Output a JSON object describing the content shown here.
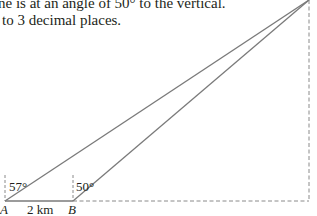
{
  "problem_text": {
    "line1": "ne is at an angle of 50° to the vertical.",
    "line2": "to 3 decimal places."
  },
  "diagram": {
    "points": {
      "A": {
        "label": "A",
        "x": 5,
        "y": 201
      },
      "B": {
        "label": "B",
        "x": 73,
        "y": 201
      },
      "Top": {
        "x": 309,
        "y": 0
      },
      "Foot": {
        "x": 309,
        "y": 201
      }
    },
    "angle_A": "57°",
    "angle_B": "50°",
    "distance_AB": "2 km",
    "colors": {
      "line": "#7a7a7a",
      "dashed": "#8a8a8a",
      "text": "#231f20"
    }
  }
}
